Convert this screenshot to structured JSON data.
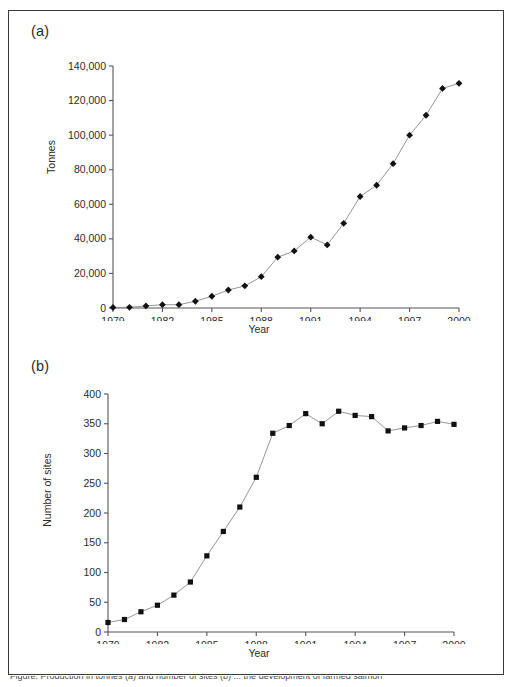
{
  "figure": {
    "panel_a_letter": "(a)",
    "panel_b_letter": "(b)",
    "caption_partial": "Figure. Production in tonnes (a) and number of sites (b) ... the development of farmed salmon"
  },
  "chart_data": [
    {
      "id": "panel-a",
      "type": "line",
      "title": "",
      "xlabel": "Year",
      "ylabel": "Tonnes",
      "xlim": [
        1979,
        2000
      ],
      "ylim": [
        0,
        140000
      ],
      "ytick_step": 20000,
      "xtick_step": 3,
      "grid": false,
      "legend": false,
      "marker": "diamond",
      "xticks": [
        "1979",
        "1982",
        "1985",
        "1988",
        "1991",
        "1994",
        "1997",
        "2000"
      ],
      "yticks": [
        "0",
        "20,000",
        "40,000",
        "60,000",
        "80,000",
        "100,000",
        "120,000",
        "140,000"
      ],
      "x": [
        1979,
        1980,
        1981,
        1982,
        1983,
        1984,
        1985,
        1986,
        1987,
        1988,
        1989,
        1990,
        1991,
        1992,
        1993,
        1994,
        1995,
        1996,
        1997,
        1998,
        1999,
        2000
      ],
      "values": [
        300,
        400,
        1200,
        1900,
        1900,
        3900,
        6800,
        10400,
        12800,
        18100,
        29400,
        33000,
        41000,
        36500,
        49000,
        64500,
        71000,
        83500,
        100000,
        111500,
        127000,
        130000
      ]
    },
    {
      "id": "panel-b",
      "type": "line",
      "title": "",
      "xlabel": "Year",
      "ylabel": "Number of sites",
      "xlim": [
        1979,
        2000
      ],
      "ylim": [
        0,
        400
      ],
      "ytick_step": 50,
      "xtick_step": 3,
      "grid": false,
      "legend": false,
      "marker": "square",
      "xticks": [
        "1979",
        "1982",
        "1985",
        "1988",
        "1991",
        "1994",
        "1997",
        "2000"
      ],
      "yticks": [
        "0",
        "50",
        "100",
        "150",
        "200",
        "250",
        "300",
        "350",
        "400"
      ],
      "x": [
        1979,
        1980,
        1981,
        1982,
        1983,
        1984,
        1985,
        1986,
        1987,
        1988,
        1989,
        1990,
        1991,
        1992,
        1993,
        1994,
        1995,
        1996,
        1997,
        1998,
        1999,
        2000
      ],
      "values": [
        16,
        21,
        34,
        45,
        62,
        84,
        128,
        169,
        210,
        260,
        334,
        347,
        367,
        350,
        371,
        364,
        362,
        338,
        343,
        347,
        354,
        349
      ]
    }
  ]
}
